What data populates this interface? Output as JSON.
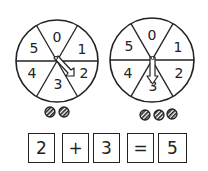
{
  "spinners": [
    {
      "id": "left",
      "center": [
        57,
        61
      ],
      "radius": 41,
      "sectors": [
        "0",
        "1",
        "2",
        "3",
        "4",
        "5"
      ],
      "result": "2",
      "tokens": 2
    },
    {
      "id": "right",
      "center": [
        152,
        60
      ],
      "radius": 42,
      "sectors": [
        "0",
        "1",
        "2",
        "3",
        "4",
        "5"
      ],
      "result": "3",
      "tokens": 3
    }
  ],
  "equation": {
    "boxes": [
      "2",
      "+",
      "3",
      "=",
      "5"
    ]
  },
  "colors": {
    "ink": "#222222",
    "background": "#ffffff"
  }
}
